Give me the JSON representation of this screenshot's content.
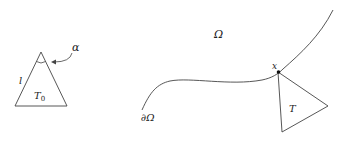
{
  "diagram": {
    "left": {
      "triangle_label": "T",
      "triangle_subscript": "0",
      "side_label": "l",
      "angle_label": "α",
      "vertices": [
        [
          41,
          52
        ],
        [
          15,
          106
        ],
        [
          67,
          106
        ]
      ]
    },
    "right": {
      "domain_label": "Ω",
      "boundary_label": "∂Ω",
      "point_label": "x",
      "triangle_label": "T",
      "point": [
        278,
        72
      ],
      "triangle_vertices": [
        [
          278,
          72
        ],
        [
          282,
          132
        ],
        [
          328,
          106
        ]
      ]
    },
    "colors": {
      "stroke": "#444444",
      "text": "#222222",
      "background": "#ffffff"
    }
  }
}
